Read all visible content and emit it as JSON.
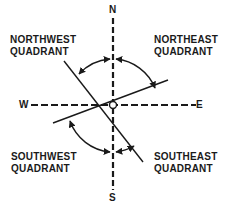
{
  "axes": {
    "north": "N",
    "south": "S",
    "east": "E",
    "west": "W"
  },
  "quadrants": {
    "northwest": {
      "line1": "NORTHWEST",
      "line2": "QUADRANT"
    },
    "northeast": {
      "line1": "NORTHEAST",
      "line2": "QUADRANT"
    },
    "southwest": {
      "line1": "SOUTHWEST",
      "line2": "QUADRANT"
    },
    "southeast": {
      "line1": "SOUTHEAST",
      "line2": "QUADRANT"
    }
  },
  "colors": {
    "ink": "#1a1a1a",
    "background": "#ffffff"
  }
}
